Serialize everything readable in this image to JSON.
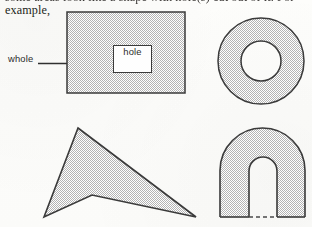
{
  "figure": {
    "caption_line_1": "some areas look like a shape with hole(s) cut out of it. For",
    "caption_line_2": "example,",
    "labels": {
      "whole": "whole",
      "hole": "hole"
    },
    "colors": {
      "paper": "#fdfdfb",
      "ink": "#231f20",
      "outline": "#3a3a3a",
      "hatch_dot": "#b4b4b4",
      "hatch_base": "#ffffff",
      "label_text": "#2b2b2b"
    },
    "shapes": [
      {
        "name": "rectangle-with-rectangular-hole",
        "kind": "rectangle",
        "position": "top-left",
        "outer": {
          "x": 67,
          "y": 12,
          "width": 118,
          "height": 81
        },
        "hole": {
          "x": 113,
          "y": 45,
          "width": 39,
          "height": 28,
          "label": "hole"
        },
        "fill": "hatch",
        "annotation": "whole"
      },
      {
        "name": "annulus-donut",
        "kind": "annulus",
        "position": "top-right",
        "center": {
          "x": 261,
          "y": 61
        },
        "outer_radius": 43,
        "inner_radius": 20,
        "fill": "hatch"
      },
      {
        "name": "concave-triangle-with-notch",
        "kind": "polygon",
        "position": "bottom-left",
        "vertices": [
          {
            "x": 78,
            "y": 128
          },
          {
            "x": 196,
            "y": 217
          },
          {
            "x": 92,
            "y": 195
          },
          {
            "x": 44,
            "y": 217
          }
        ],
        "fill": "hatch"
      },
      {
        "name": "arch-inverted-u",
        "kind": "arch",
        "position": "bottom-right",
        "outer": {
          "left": 220,
          "right": 305,
          "bottom": 217,
          "arc_top": 128
        },
        "inner": {
          "left": 249,
          "right": 277,
          "bottom": 217,
          "arc_top": 157
        },
        "bottom_opening_line": "dashed",
        "fill": "hatch"
      }
    ]
  }
}
